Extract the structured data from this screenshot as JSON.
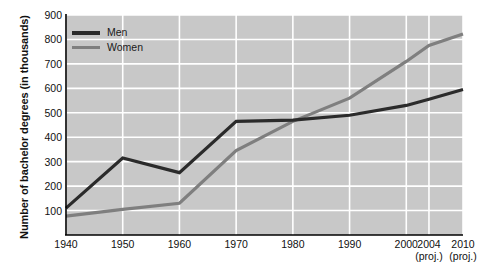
{
  "chart_data": {
    "type": "line",
    "title": "",
    "xlabel": "",
    "ylabel": "Number of bachelor degrees (in thousands)",
    "x": [
      1940,
      1950,
      1960,
      1970,
      1980,
      1990,
      2000,
      2004,
      2010
    ],
    "categories": [
      "1940",
      "1950",
      "1960",
      "1970",
      "1980",
      "1990",
      "2000",
      "2004",
      "2010"
    ],
    "xtick_labels": [
      {
        "label": "1940",
        "note": ""
      },
      {
        "label": "1950",
        "note": ""
      },
      {
        "label": "1960",
        "note": ""
      },
      {
        "label": "1970",
        "note": ""
      },
      {
        "label": "1980",
        "note": ""
      },
      {
        "label": "1990",
        "note": ""
      },
      {
        "label": "2000",
        "note": ""
      },
      {
        "label": "2004",
        "note": "(proj.)"
      },
      {
        "label": "2010",
        "note": "(proj.)"
      }
    ],
    "ytick_labels": [
      "900",
      "800",
      "700",
      "600",
      "500",
      "400",
      "300",
      "200",
      "100"
    ],
    "ytick_values": [
      900,
      800,
      700,
      600,
      500,
      400,
      300,
      200,
      100
    ],
    "ylim": [
      0,
      900
    ],
    "xlim": [
      1940,
      2010
    ],
    "grid": true,
    "grid_color": "#ffffff",
    "plot_background": "#c8c8c8",
    "legend_position": "top-left-inside",
    "series": [
      {
        "name": "Men",
        "color": "#2b2b2b",
        "values": [
          110,
          315,
          255,
          465,
          470,
          490,
          530,
          555,
          595
        ]
      },
      {
        "name": "Women",
        "color": "#7f7f7f",
        "values": [
          77,
          105,
          130,
          345,
          465,
          560,
          710,
          775,
          822
        ]
      }
    ]
  },
  "legend": {
    "items": [
      {
        "label": "Men",
        "color": "#2b2b2b"
      },
      {
        "label": "Women",
        "color": "#7f7f7f"
      }
    ]
  }
}
